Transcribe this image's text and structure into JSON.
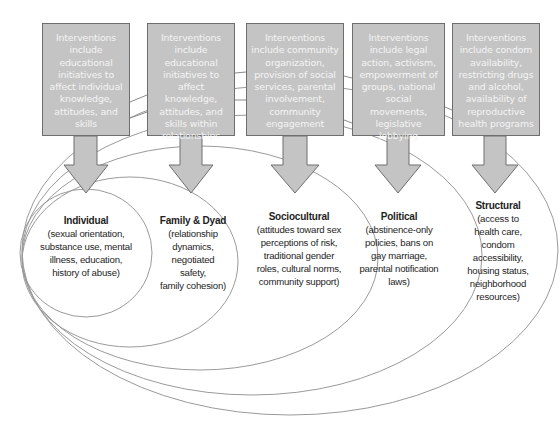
{
  "diagram": {
    "type": "nested-ecological-model",
    "colors": {
      "box_fill": "#c4c4c4",
      "box_border": "#6e6e6e",
      "box_text": "#f4f4f4",
      "arrow_fill": "#c4c4c4",
      "ellipse_stroke": "#9a9a9a",
      "level_text": "#1e1e1e"
    },
    "interventions": [
      {
        "text": "Interventions include educational initiatives to affect individual knowledge, attitudes, and skills"
      },
      {
        "text": "Interventions include educational initiatives to affect knowledge, attitudes, and skills within relationships"
      },
      {
        "text": "Interventions include community organization, provision of social services, parental involvement, community engagement"
      },
      {
        "text": "Interventions include legal action, activism, empowerment of groups, national social movements, legislative lobbying"
      },
      {
        "text": "Interventions include condom availability, restricting drugs and alcohol, availability of reproductive health programs"
      }
    ],
    "levels": [
      {
        "title": "Individual",
        "description": "(sexual orientation,\nsubstance use, mental\nillness, education,\nhistory of abuse)"
      },
      {
        "title": "Family & Dyad",
        "description": "(relationship\ndynamics,\nnegotiated safety,\nfamily cohesion)"
      },
      {
        "title": "Sociocultural",
        "description": "(attitudes toward sex\nperceptions of risk,\ntraditional gender\nroles, cultural norms,\ncommunity support)"
      },
      {
        "title": "Political",
        "description": "(abstinence-only\npolicies, bans on\ngay marriage,\nparental notification\nlaws)"
      },
      {
        "title": "Structural",
        "description": "(access to\nhealth care, condom\naccessibility,\nhousing status,\nneighborhood\nresources)"
      }
    ]
  }
}
